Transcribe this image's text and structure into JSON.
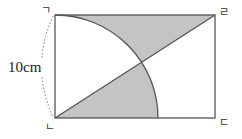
{
  "diagram": {
    "type": "geometry",
    "dimension_label": "10cm",
    "corner_labels": {
      "top_left": "ㄱ",
      "top_right": "ㄹ",
      "bottom_left": "ㄴ",
      "bottom_right": "ㄷ"
    },
    "colors": {
      "stroke": "#555555",
      "shade": "#c4c4c4",
      "dotted": "#777777"
    }
  }
}
